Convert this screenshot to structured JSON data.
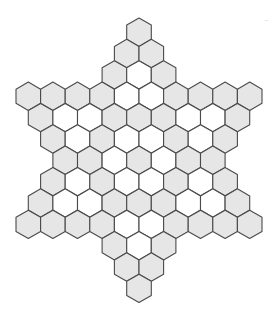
{
  "diagram": {
    "title": "",
    "shape": "six-pointed hexagonal star board",
    "colors": {
      "gray_fill": "#e6e6e6",
      "white_fill": "#ffffff",
      "stroke": "#4a4a4a",
      "background": "#ffffff"
    },
    "geometry": {
      "center_x": 139,
      "first_row_center_y": 32.2,
      "hex_width": 24.6,
      "row_spacing": 21.35
    },
    "legend": {
      "G": "gray cell",
      "W": "white cell"
    },
    "rows": [
      [
        "G"
      ],
      [
        "G",
        "G"
      ],
      [
        "G",
        "W",
        "G"
      ],
      [
        "G",
        "G",
        "G",
        "G",
        "W",
        "W",
        "G",
        "G",
        "G",
        "G"
      ],
      [
        "G",
        "W",
        "W",
        "G",
        "G",
        "G",
        "W",
        "W",
        "G"
      ],
      [
        "G",
        "W",
        "G",
        "W",
        "W",
        "G",
        "W",
        "G"
      ],
      [
        "G",
        "G",
        "W",
        "G",
        "W",
        "G",
        "G"
      ],
      [
        "G",
        "W",
        "G",
        "W",
        "W",
        "G",
        "W",
        "G"
      ],
      [
        "G",
        "W",
        "W",
        "G",
        "G",
        "G",
        "W",
        "W",
        "G"
      ],
      [
        "G",
        "G",
        "G",
        "G",
        "W",
        "W",
        "G",
        "G",
        "G",
        "G"
      ],
      [
        "G",
        "W",
        "G"
      ],
      [
        "G",
        "G"
      ],
      [
        "G"
      ]
    ]
  }
}
